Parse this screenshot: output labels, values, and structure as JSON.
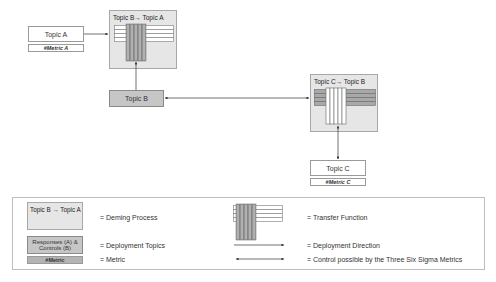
{
  "diagram": {
    "topic_a": {
      "label": "Topic A",
      "metric": "#Metric A"
    },
    "deming_ba": {
      "title": "Topic B→ Topic A"
    },
    "topic_b": {
      "label": "Topic B"
    },
    "deming_cb": {
      "title": "Topic C→ Topic B"
    },
    "topic_c": {
      "label": "Topic C",
      "metric": "#Metric C"
    }
  },
  "legend": {
    "deming_sample": "Topic B → Topic A",
    "deming_desc": "= Deming Process",
    "topics_sample": "Responses (A) & Controls (B)",
    "topics_desc": "= Deployment Topics",
    "metric_sample": "#Metric",
    "metric_desc": "= Metric",
    "transfer_desc": "= Transfer Function",
    "direction_desc": "= Deployment Direction",
    "control_desc": "= Control possible by the Three Six Sigma Metrics"
  },
  "colors": {
    "deming_bg": "#e6e6e6",
    "topic_gray": "#c6c6c6",
    "transfer_gray": "#a0a0a0",
    "line": "#333333"
  }
}
